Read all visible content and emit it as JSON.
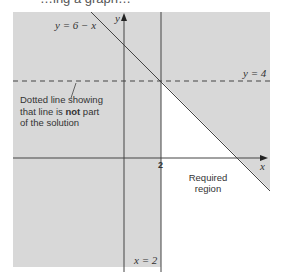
{
  "header": {
    "partial_title": "…ing a graph…"
  },
  "diagram": {
    "line_diagonal_label": "y = 6 − x",
    "line_horizontal_label": "y = 4",
    "line_vertical_label": "x = 2",
    "x_axis_label": "x",
    "y_axis_label": "y",
    "tick_label_x": "2",
    "annotation": {
      "line1": "Dotted line showing",
      "line2_pre": "that line is ",
      "line2_bold": "not",
      "line2_post": " part",
      "line3": "of the solution"
    },
    "region_label_line1": "Required",
    "region_label_line2": "region",
    "colors": {
      "shaded": "#d8d8d8",
      "line": "#444444",
      "background": "#ffffff"
    }
  }
}
